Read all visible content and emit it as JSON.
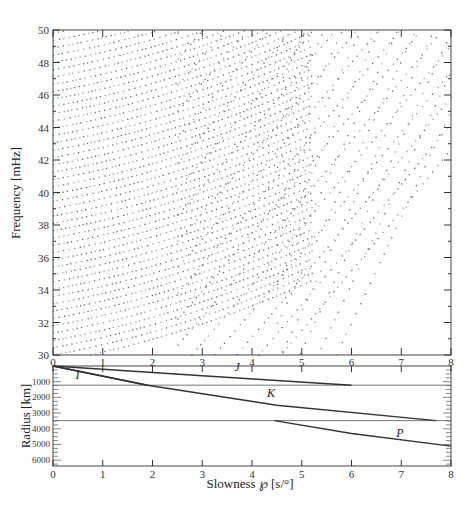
{
  "chart_data": [
    {
      "type": "scatter",
      "title": "",
      "xlabel": "",
      "ylabel": "Frequency [mHz]",
      "xlim": [
        0,
        8
      ],
      "ylim": [
        30,
        50
      ],
      "x_ticks": [
        "0",
        "1",
        "2",
        "3",
        "4",
        "5",
        "6",
        "7",
        "8"
      ],
      "y_ticks": [
        "30",
        "32",
        "34",
        "36",
        "38",
        "40",
        "42",
        "44",
        "46",
        "48",
        "50"
      ],
      "grid": false,
      "description": "Dispersion branches (normal-mode dots) of frequency vs slowness; near-horizontal branches at low slowness, steeply rising branches at high slowness",
      "families": [
        {
          "name": "flat-branches",
          "count": 46,
          "f0_start": 29.6,
          "f0_step": 0.45,
          "slope": 0.55,
          "x_range": [
            0,
            5.2
          ]
        },
        {
          "name": "mid-branches",
          "count": 26,
          "f0_start": 14.0,
          "f0_step": 1.6,
          "slope": 3.4,
          "x_range": [
            2.5,
            8
          ]
        },
        {
          "name": "steep-branches",
          "count": 22,
          "f0_start": -6.0,
          "f0_step": 2.4,
          "slope": 6.2,
          "x_range": [
            4.5,
            8
          ]
        }
      ]
    },
    {
      "type": "line",
      "xlabel": "Slowness ℘ [s/°]",
      "ylabel": "Radius [km]",
      "xlim": [
        0,
        8
      ],
      "ylim": [
        6371,
        0
      ],
      "x_ticks": [
        "0",
        "1",
        "2",
        "3",
        "4",
        "5",
        "6",
        "7",
        "8"
      ],
      "y_ticks": [
        "1000",
        "2000",
        "3000",
        "4000",
        "5000",
        "6000"
      ],
      "boundaries_km": [
        1221,
        3480
      ],
      "series": [
        {
          "name": "I",
          "points": [
            [
              0,
              0
            ],
            [
              1.9,
              1221
            ]
          ]
        },
        {
          "name": "J",
          "points": [
            [
              0,
              0
            ],
            [
              3,
              620
            ],
            [
              6,
              1221
            ]
          ]
        },
        {
          "name": "K",
          "points": [
            [
              0,
              0
            ],
            [
              1.9,
              1221
            ],
            [
              4.5,
              2500
            ],
            [
              7.7,
              3480
            ]
          ]
        },
        {
          "name": "P",
          "points": [
            [
              4.45,
              3480
            ],
            [
              6,
              4300
            ],
            [
              8,
              5100
            ]
          ]
        }
      ],
      "annotations": [
        {
          "text": "I",
          "x": 0.45,
          "y": 800
        },
        {
          "text": "J",
          "x": 3.65,
          "y": 350
        },
        {
          "text": "K",
          "x": 4.3,
          "y": 1950
        },
        {
          "text": "P",
          "x": 6.9,
          "y": 4500
        }
      ]
    }
  ],
  "labels": {
    "freq_axis": "Frequency [mHz]",
    "radius_axis": "Radius [km]",
    "slowness_axis": "Slowness ℘ [s/°]"
  }
}
